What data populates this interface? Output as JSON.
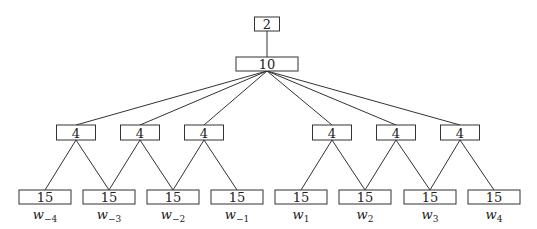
{
  "diagram": {
    "root": {
      "value": "2",
      "x": 267,
      "y": 17,
      "w": 25,
      "h": 14
    },
    "level1": {
      "value": "10",
      "x": 267,
      "y": 57,
      "w": 62,
      "h": 14
    },
    "level2": [
      {
        "value": "4",
        "x": 76
      },
      {
        "value": "4",
        "x": 140
      },
      {
        "value": "4",
        "x": 204
      },
      {
        "value": "4",
        "x": 332
      },
      {
        "value": "4",
        "x": 396
      },
      {
        "value": "4",
        "x": 460
      }
    ],
    "leaves": [
      {
        "value": "15",
        "x": 45,
        "label": "w",
        "sub": "−4"
      },
      {
        "value": "15",
        "x": 109,
        "label": "w",
        "sub": "−3"
      },
      {
        "value": "15",
        "x": 173,
        "label": "w",
        "sub": "−2"
      },
      {
        "value": "15",
        "x": 237,
        "label": "w",
        "sub": "−1"
      },
      {
        "value": "15",
        "x": 301,
        "label": "w",
        "sub": "1"
      },
      {
        "value": "15",
        "x": 365,
        "label": "w",
        "sub": "2"
      },
      {
        "value": "15",
        "x": 430,
        "label": "w",
        "sub": "3"
      },
      {
        "value": "15",
        "x": 494,
        "label": "w",
        "sub": "4"
      }
    ],
    "edges_level2_to_leaves": [
      [
        0,
        0
      ],
      [
        0,
        1
      ],
      [
        1,
        1
      ],
      [
        1,
        2
      ],
      [
        2,
        2
      ],
      [
        2,
        3
      ],
      [
        3,
        4
      ],
      [
        3,
        5
      ],
      [
        4,
        5
      ],
      [
        4,
        6
      ],
      [
        5,
        6
      ],
      [
        5,
        7
      ]
    ]
  }
}
